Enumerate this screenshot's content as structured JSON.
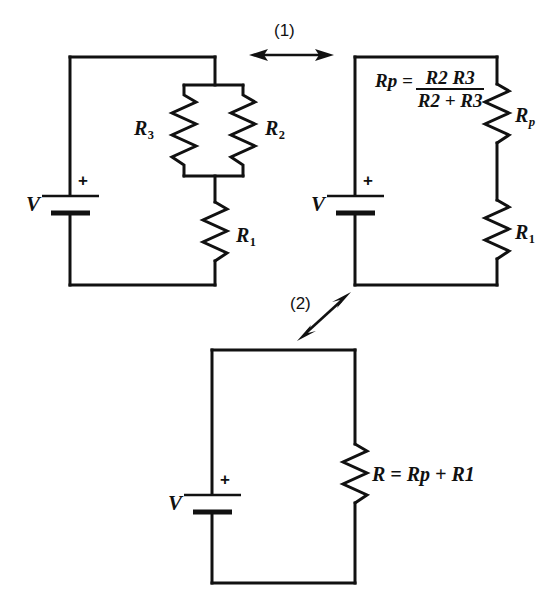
{
  "figure": {
    "background_color": "#ffffff",
    "line_color": "#111111"
  },
  "steps": [
    {
      "id": "step-1",
      "label": "(1)",
      "arrow": "horizontal-double-arrow"
    },
    {
      "id": "step-2",
      "label": "(2)",
      "arrow": "diagonal-double-arrow"
    }
  ],
  "circuits": [
    {
      "id": "circuit-original",
      "source": {
        "label": "V",
        "polarity": "+"
      },
      "components": [
        {
          "name": "R3",
          "base": "R",
          "sub": "3",
          "type": "resistor"
        },
        {
          "name": "R2",
          "base": "R",
          "sub": "2",
          "type": "resistor"
        },
        {
          "name": "R1",
          "base": "R",
          "sub": "1",
          "type": "resistor"
        }
      ]
    },
    {
      "id": "circuit-parallel-combined",
      "source": {
        "label": "V",
        "polarity": "+"
      },
      "components": [
        {
          "name": "Rp",
          "base": "R",
          "sub": "p",
          "type": "resistor"
        },
        {
          "name": "R1",
          "base": "R",
          "sub": "1",
          "type": "resistor"
        }
      ],
      "formula": {
        "lead_base": "R",
        "lead_sub": "p",
        "equals": "=",
        "numerator_1_base": "R",
        "numerator_1_sub": "2",
        "numerator_2_base": "R",
        "numerator_2_sub": "3",
        "denominator_1_base": "R",
        "denominator_1_sub": "2",
        "denominator_plus": "+",
        "denominator_2_base": "R",
        "denominator_2_sub": "3",
        "plain_text": "Rp = R2 R3 / (R2 + R3)"
      }
    },
    {
      "id": "circuit-total",
      "source": {
        "label": "V",
        "polarity": "+"
      },
      "components": [
        {
          "name": "R",
          "base": "R",
          "sub": "",
          "type": "resistor"
        }
      ],
      "equation": {
        "lhs_base": "R",
        "equals": "=",
        "rhs_1_base": "R",
        "rhs_1_sub": "p",
        "plus": "+",
        "rhs_2_base": "R",
        "rhs_2_sub": "1",
        "plain_text": "R = Rp + R1"
      }
    }
  ]
}
